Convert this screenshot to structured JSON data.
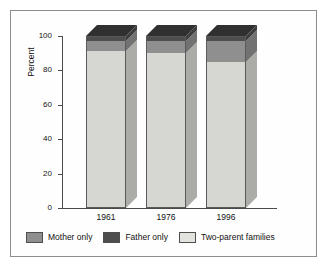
{
  "chart_data": {
    "type": "bar",
    "subtype": "stacked-3d-column",
    "title": "",
    "xlabel": "",
    "ylabel": "Percent",
    "categories": [
      "1961",
      "1976",
      "1996"
    ],
    "ylim": [
      0,
      100
    ],
    "ytick_labels": [
      "0",
      "20",
      "40",
      "60",
      "80",
      "100"
    ],
    "ytick_values": [
      0,
      20,
      40,
      60,
      80,
      100
    ],
    "grid": false,
    "legend_position": "bottom",
    "series": [
      {
        "name": "Two-parent families",
        "color": "#d6d6d2",
        "values": [
          91,
          90,
          85
        ]
      },
      {
        "name": "Mother only",
        "color": "#8f8f8f",
        "values": [
          6,
          7,
          12
        ]
      },
      {
        "name": "Father only",
        "color": "#4d4d4d",
        "values": [
          3,
          3,
          3
        ]
      }
    ],
    "stack_order_bottom_to_top": [
      "Two-parent families",
      "Mother only",
      "Father only"
    ]
  },
  "legend": {
    "items": [
      {
        "label": "Mother only",
        "color": "#8f8f8f"
      },
      {
        "label": "Father only",
        "color": "#4d4d4d"
      },
      {
        "label": "Two-parent families",
        "color": "#e2e2de"
      }
    ]
  },
  "axes": {
    "y_label": "Percent",
    "y_ticks": [
      "100",
      "80",
      "60",
      "40",
      "20",
      "0"
    ],
    "x_ticks": [
      "1961",
      "1976",
      "1996"
    ]
  },
  "colors": {
    "frame": "#8d8d8d",
    "axis": "#4a4a4a",
    "background": "#fefefe",
    "two_parent": "#d6d6d2",
    "mother_only": "#8f8f8f",
    "father_only": "#4d4d4d"
  }
}
